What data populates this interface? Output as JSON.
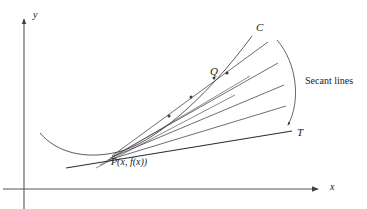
{
  "figure": {
    "type": "diagram",
    "background_color": "#ffffff",
    "stroke_color": "#3d3d42",
    "axes": {
      "x_label": "x",
      "y_label": "y",
      "x_axis": {
        "x1": 3,
        "y1": 189,
        "x2": 322,
        "y2": 189,
        "arrow": "right"
      },
      "y_axis": {
        "x1": 24,
        "y1": 209,
        "x2": 24,
        "y2": 15,
        "arrow": "up"
      }
    },
    "labels": {
      "curve": "C",
      "secant_point": "Q",
      "tangent": "T",
      "base_point": "P(x, f(x))",
      "annotation": "Secant lines"
    },
    "curve": {
      "name": "C",
      "path": "M 40,133 C 56,152 84,160 118,152 C 152,144 205,100 252,36",
      "min_point": [
        72,
        158
      ]
    },
    "tangent_line": {
      "name": "T",
      "from": [
        68,
        167
      ],
      "to": [
        292,
        131
      ]
    },
    "secant_lines": [
      {
        "from": [
          118,
          152
        ],
        "to": [
          268,
          42
        ]
      },
      {
        "from": [
          118,
          152
        ],
        "to": [
          278,
          63
        ]
      },
      {
        "from": [
          118,
          152
        ],
        "to": [
          284,
          85
        ]
      },
      {
        "from": [
          118,
          152
        ],
        "to": [
          286,
          106
        ]
      }
    ],
    "intersection_dots": [
      [
        212,
        78
      ],
      [
        190,
        97
      ],
      [
        168,
        116
      ]
    ],
    "secant_bracket": {
      "path": "M 277,40 C 296,62 300,100 287,127",
      "arrow_at": [
        287,
        127
      ]
    }
  }
}
